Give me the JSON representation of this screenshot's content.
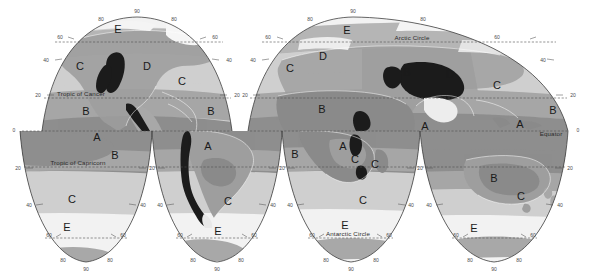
{
  "map": {
    "title": "World Climate Regions",
    "projection": "interrupted homolosine",
    "width": 589,
    "height": 279,
    "background_color": "#ffffff"
  },
  "reference_lines": [
    {
      "id": "tropic-of-cancer",
      "label": "Tropic of Cancer",
      "latitude": 23.5,
      "y": 98
    },
    {
      "id": "tropic-of-capricorn",
      "label": "Tropic of Capricorn",
      "latitude": -23.5,
      "y": 167
    },
    {
      "id": "arctic-circle",
      "label": "Arctic Circle",
      "latitude": 66.5,
      "y": 42
    },
    {
      "id": "antarctic-circle",
      "label": "Antarctic Circle",
      "latitude": -66.5,
      "y": 238
    },
    {
      "id": "equator",
      "label": "Equator",
      "latitude": 0,
      "y": 131
    }
  ],
  "latitude_ticks": [
    "90",
    "80",
    "60",
    "40",
    "20",
    "0",
    "20",
    "40",
    "60",
    "80",
    "90"
  ],
  "climate_zones": {
    "legend_note": "Koppen climate group letters",
    "groups": [
      {
        "letter": "A",
        "name": "Tropical",
        "color": "#8e8e8e"
      },
      {
        "letter": "B",
        "name": "Dry",
        "color": "#a6a6a6"
      },
      {
        "letter": "C",
        "name": "Temperate",
        "color": "#cfcfcf"
      },
      {
        "letter": "D",
        "name": "Continental",
        "color": "#b5b5b5"
      },
      {
        "letter": "E",
        "name": "Polar",
        "color": "#f2f2f2"
      },
      {
        "letter": "H",
        "name": "Highland",
        "color": "#1c1c1c"
      }
    ]
  },
  "zone_labels": [
    {
      "letter": "E",
      "x": 118,
      "y": 33
    },
    {
      "letter": "C",
      "x": 80,
      "y": 70
    },
    {
      "letter": "D",
      "x": 147,
      "y": 70
    },
    {
      "letter": "C",
      "x": 182,
      "y": 85
    },
    {
      "letter": "B",
      "x": 86,
      "y": 115
    },
    {
      "letter": "B",
      "x": 211,
      "y": 115
    },
    {
      "letter": "A",
      "x": 97,
      "y": 141
    },
    {
      "letter": "B",
      "x": 115,
      "y": 159
    },
    {
      "letter": "C",
      "x": 72,
      "y": 203
    },
    {
      "letter": "E",
      "x": 67,
      "y": 231
    },
    {
      "letter": "A",
      "x": 208,
      "y": 150
    },
    {
      "letter": "C",
      "x": 228,
      "y": 205
    },
    {
      "letter": "E",
      "x": 218,
      "y": 235
    },
    {
      "letter": "E",
      "x": 347,
      "y": 34
    },
    {
      "letter": "D",
      "x": 323,
      "y": 60
    },
    {
      "letter": "C",
      "x": 290,
      "y": 72
    },
    {
      "letter": "B",
      "x": 407,
      "y": 76
    },
    {
      "letter": "D",
      "x": 450,
      "y": 78
    },
    {
      "letter": "C",
      "x": 497,
      "y": 89
    },
    {
      "letter": "B",
      "x": 553,
      "y": 114
    },
    {
      "letter": "B",
      "x": 322,
      "y": 113
    },
    {
      "letter": "A",
      "x": 425,
      "y": 130
    },
    {
      "letter": "A",
      "x": 520,
      "y": 128
    },
    {
      "letter": "A",
      "x": 343,
      "y": 150
    },
    {
      "letter": "C",
      "x": 355,
      "y": 163
    },
    {
      "letter": "B",
      "x": 360,
      "y": 176
    },
    {
      "letter": "C",
      "x": 375,
      "y": 168
    },
    {
      "letter": "B",
      "x": 295,
      "y": 158
    },
    {
      "letter": "C",
      "x": 363,
      "y": 204
    },
    {
      "letter": "E",
      "x": 345,
      "y": 229
    },
    {
      "letter": "B",
      "x": 494,
      "y": 182
    },
    {
      "letter": "C",
      "x": 521,
      "y": 200
    },
    {
      "letter": "E",
      "x": 474,
      "y": 232
    }
  ],
  "lobes": {
    "northern": [
      {
        "id": "north-americas",
        "left": 42,
        "right": 232,
        "apex_x": 137
      },
      {
        "id": "north-eurafrica",
        "left": 248,
        "right": 568,
        "apex_x": 353
      }
    ],
    "southern": [
      {
        "id": "south-pacific-w",
        "left": 20,
        "right": 152,
        "apex_x": 86
      },
      {
        "id": "south-americas",
        "left": 152,
        "right": 282,
        "apex_x": 217
      },
      {
        "id": "south-africa",
        "left": 282,
        "right": 420,
        "apex_x": 351
      },
      {
        "id": "south-australia",
        "left": 420,
        "right": 568,
        "apex_x": 494
      }
    ]
  }
}
